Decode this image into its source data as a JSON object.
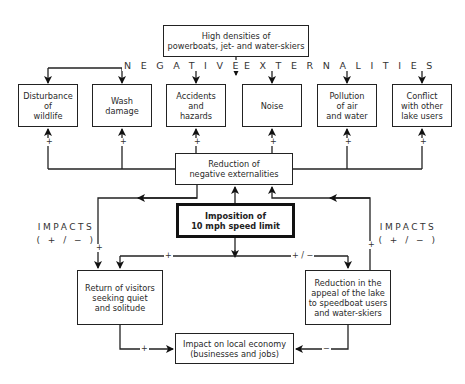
{
  "diagram": {
    "top_box": "High densities of\npowerboats, jet- and water-skiers",
    "banner_left": "NEGATIVE",
    "banner_right": "EXTERNALITIES",
    "externalities": [
      {
        "label": "Disturbance\nof\nwildlife"
      },
      {
        "label": "Wash\ndamage"
      },
      {
        "label": "Accidents\nand\nhazards"
      },
      {
        "label": "Noise"
      },
      {
        "label": "Pollution\nof air\nand water"
      },
      {
        "label": "Conflict\nwith other\nlake users"
      }
    ],
    "reduction_box": "Reduction of\nnegative externalities",
    "policy_box": "Imposition of\n10 mph speed limit",
    "impacts_left": "IMPACTS\n( + / − )",
    "impacts_right": "IMPACTS\n( + / − )",
    "return_box": "Return of visitors\nseeking quiet\nand solitude",
    "appeal_box": "Reduction in the\nappeal of the lake\nto speedboat users\nand water-skiers",
    "economy_box": "Impact on local economy\n(businesses and jobs)",
    "signs": {
      "plus": "+",
      "minus": "−",
      "plus_minus": "+ / −"
    }
  }
}
